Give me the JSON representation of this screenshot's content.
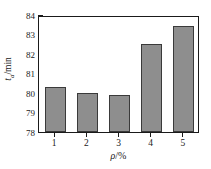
{
  "chart_data": {
    "type": "bar",
    "title": "",
    "subtitle": "",
    "categories": [
      "1",
      "2",
      "3",
      "4",
      "5"
    ],
    "values": [
      80.3,
      80.0,
      79.9,
      82.5,
      83.45
    ],
    "xlabel": "ρ/%",
    "ylabel": "tₐ/min",
    "ylabel_symbol": "t",
    "ylabel_subscript": "a",
    "ylabel_unit": "/min",
    "xlabel_symbol": "ρ",
    "xlabel_unit": "/%",
    "ylim": [
      78,
      84
    ],
    "yticks": [
      "84",
      "83",
      "82",
      "81",
      "80",
      "79",
      "78"
    ],
    "ytick_values": [
      84,
      83,
      82,
      81,
      80,
      79,
      78
    ],
    "xticks": [
      "1",
      "2",
      "3",
      "4",
      "5"
    ],
    "grid": false,
    "legend": false,
    "legend_position": "none",
    "bar_fill_color": "#8e8e8e",
    "bar_edge_color": "#3a3a3a",
    "axis_color": "#1a1a1a",
    "background_color": "#ffffff"
  }
}
